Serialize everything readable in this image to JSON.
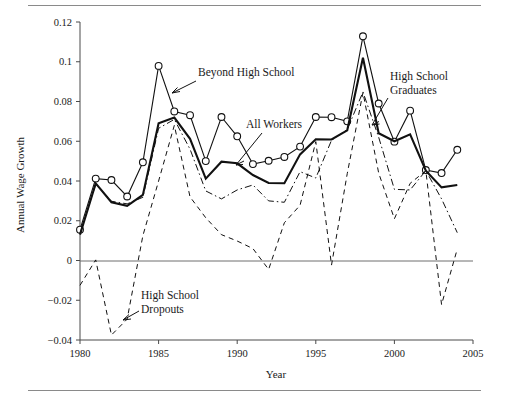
{
  "figure": {
    "has_top_rule": true,
    "has_bottom_rule": true
  },
  "chart_data": {
    "type": "line",
    "title": "",
    "xlabel": "Year",
    "ylabel": "Annual Wage Growth",
    "xlim": [
      1980,
      2005
    ],
    "ylim": [
      -0.04,
      0.12
    ],
    "xticks": [
      1980,
      1985,
      1990,
      1995,
      2000,
      2005
    ],
    "xtick_labels": [
      "1980",
      "1985",
      "1990",
      "1995",
      "2000",
      "2005"
    ],
    "yticks": [
      -0.04,
      -0.02,
      0,
      0.02,
      0.04,
      0.06,
      0.08,
      0.1,
      0.12
    ],
    "ytick_labels": [
      "−0.04",
      "−0.02",
      "0",
      "0.02",
      "0.04",
      "0.06",
      "0.08",
      "0.1",
      "0.12"
    ],
    "grid": false,
    "legend": "annotated-inline",
    "zero_reference_line": 0,
    "x": [
      1980,
      1981,
      1982,
      1983,
      1984,
      1985,
      1986,
      1987,
      1988,
      1989,
      1990,
      1991,
      1992,
      1993,
      1994,
      1995,
      1996,
      1997,
      1998,
      1999,
      2000,
      2001,
      2002,
      2003,
      2004
    ],
    "series": [
      {
        "name": "Beyond High School",
        "style": "solid-thin-with-open-circle-markers",
        "markers": true,
        "values": [
          0.0155,
          0.0412,
          0.0405,
          0.0322,
          0.0494,
          0.0979,
          0.075,
          0.0731,
          0.05,
          0.0722,
          0.0625,
          0.0485,
          0.0502,
          0.0521,
          0.0573,
          0.0722,
          0.0721,
          0.07,
          0.1128,
          0.079,
          0.0598,
          0.0754,
          0.0455,
          0.044,
          0.0557
        ]
      },
      {
        "name": "High School Graduates",
        "style": "solid-thick",
        "markers": false,
        "values": [
          0.013,
          0.0388,
          0.0293,
          0.0275,
          0.033,
          0.069,
          0.0719,
          0.0612,
          0.0412,
          0.0497,
          0.0489,
          0.043,
          0.039,
          0.0389,
          0.0534,
          0.061,
          0.0609,
          0.0655,
          0.102,
          0.064,
          0.06,
          0.0635,
          0.0452,
          0.0368,
          0.038
        ]
      },
      {
        "name": "All Workers",
        "style": "dash-dot-thin",
        "markers": false,
        "values": [
          0.0135,
          0.0384,
          0.0298,
          0.0285,
          0.0318,
          0.0665,
          0.071,
          0.056,
          0.035,
          0.031,
          0.0355,
          0.038,
          0.03,
          0.0293,
          0.0447,
          0.0415,
          0.0605,
          0.0659,
          0.0848,
          0.062,
          0.0358,
          0.0355,
          0.0452,
          0.031,
          0.014
        ]
      },
      {
        "name": "High School Dropouts",
        "style": "dashed",
        "markers": false,
        "values": [
          -0.0125,
          0.0003,
          -0.0375,
          -0.0295,
          0.0125,
          0.04,
          0.068,
          0.032,
          0.0215,
          0.013,
          0.0098,
          0.006,
          -0.0045,
          0.019,
          0.0278,
          0.0598,
          -0.0023,
          0.0437,
          0.0845,
          0.044,
          0.021,
          0.0388,
          0.0452,
          -0.0222,
          0.0058
        ]
      }
    ],
    "annotations": [
      {
        "id": "beyond-high-school",
        "text": "Beyond High School",
        "points_to_year": 1985
      },
      {
        "id": "high-school-graduates",
        "text_line1": "High School",
        "text_line2": "Graduates",
        "points_to_year": 1998
      },
      {
        "id": "all-workers",
        "text": "All Workers",
        "points_to_year": 1989
      },
      {
        "id": "high-school-dropouts",
        "text_line1": "High School",
        "text_line2": "Dropouts",
        "points_to_year": 1983
      }
    ]
  }
}
